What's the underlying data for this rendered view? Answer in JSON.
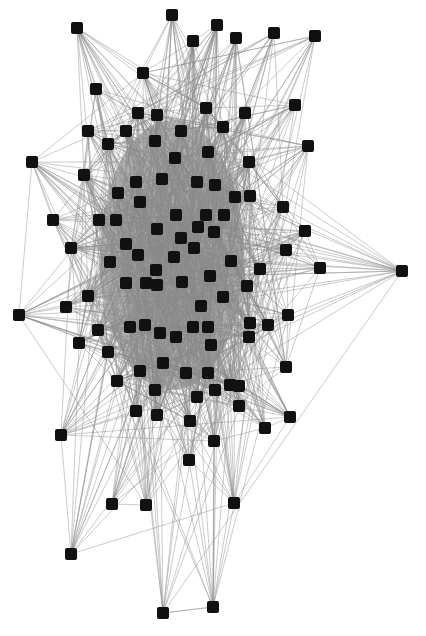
{
  "diagram": {
    "type": "network-graph",
    "canvas": {
      "width": 426,
      "height": 636,
      "background": "#ffffff"
    },
    "style": {
      "node_color": "#111111",
      "edge_color": "#8a8a8a",
      "core_color": "#7d7d7d",
      "node_size": 12
    },
    "core_region": {
      "cx": 172,
      "cy": 255,
      "rx": 72,
      "ry": 135
    },
    "nodes": [
      [
        77,
        28
      ],
      [
        172,
        15
      ],
      [
        217,
        25
      ],
      [
        193,
        41
      ],
      [
        236,
        38
      ],
      [
        274,
        33
      ],
      [
        315,
        36
      ],
      [
        143,
        73
      ],
      [
        96,
        89
      ],
      [
        295,
        105
      ],
      [
        138,
        113
      ],
      [
        157,
        115
      ],
      [
        206,
        108
      ],
      [
        245,
        113
      ],
      [
        88,
        131
      ],
      [
        126,
        131
      ],
      [
        181,
        131
      ],
      [
        223,
        127
      ],
      [
        108,
        144
      ],
      [
        155,
        141
      ],
      [
        208,
        152
      ],
      [
        308,
        146
      ],
      [
        32,
        162
      ],
      [
        84,
        175
      ],
      [
        175,
        158
      ],
      [
        249,
        162
      ],
      [
        136,
        182
      ],
      [
        162,
        179
      ],
      [
        197,
        182
      ],
      [
        215,
        185
      ],
      [
        118,
        193
      ],
      [
        235,
        197
      ],
      [
        283,
        207
      ],
      [
        53,
        220
      ],
      [
        99,
        220
      ],
      [
        116,
        220
      ],
      [
        140,
        202
      ],
      [
        176,
        215
      ],
      [
        206,
        215
      ],
      [
        224,
        215
      ],
      [
        250,
        196
      ],
      [
        305,
        231
      ],
      [
        71,
        248
      ],
      [
        126,
        244
      ],
      [
        157,
        229
      ],
      [
        181,
        238
      ],
      [
        198,
        227
      ],
      [
        214,
        232
      ],
      [
        286,
        250
      ],
      [
        138,
        255
      ],
      [
        110,
        262
      ],
      [
        156,
        270
      ],
      [
        174,
        257
      ],
      [
        194,
        248
      ],
      [
        231,
        261
      ],
      [
        260,
        269
      ],
      [
        320,
        268
      ],
      [
        402,
        271
      ],
      [
        146,
        283
      ],
      [
        126,
        283
      ],
      [
        157,
        285
      ],
      [
        182,
        282
      ],
      [
        210,
        276
      ],
      [
        223,
        297
      ],
      [
        201,
        306
      ],
      [
        247,
        286
      ],
      [
        88,
        296
      ],
      [
        66,
        307
      ],
      [
        19,
        315
      ],
      [
        288,
        315
      ],
      [
        145,
        325
      ],
      [
        98,
        330
      ],
      [
        130,
        327
      ],
      [
        160,
        333
      ],
      [
        193,
        327
      ],
      [
        208,
        327
      ],
      [
        250,
        323
      ],
      [
        268,
        325
      ],
      [
        176,
        337
      ],
      [
        211,
        345
      ],
      [
        79,
        343
      ],
      [
        108,
        352
      ],
      [
        163,
        363
      ],
      [
        140,
        371
      ],
      [
        249,
        337
      ],
      [
        286,
        367
      ],
      [
        117,
        381
      ],
      [
        186,
        373
      ],
      [
        208,
        373
      ],
      [
        230,
        385
      ],
      [
        239,
        386
      ],
      [
        155,
        390
      ],
      [
        197,
        397
      ],
      [
        215,
        390
      ],
      [
        136,
        411
      ],
      [
        157,
        415
      ],
      [
        190,
        421
      ],
      [
        239,
        406
      ],
      [
        290,
        417
      ],
      [
        61,
        435
      ],
      [
        265,
        428
      ],
      [
        214,
        441
      ],
      [
        189,
        460
      ],
      [
        112,
        504
      ],
      [
        146,
        505
      ],
      [
        234,
        503
      ],
      [
        71,
        554
      ],
      [
        163,
        613
      ],
      [
        213,
        607
      ]
    ],
    "edges_seed": 7,
    "edges_per_node_core": 22,
    "edges_per_node_peripheral": 6
  }
}
